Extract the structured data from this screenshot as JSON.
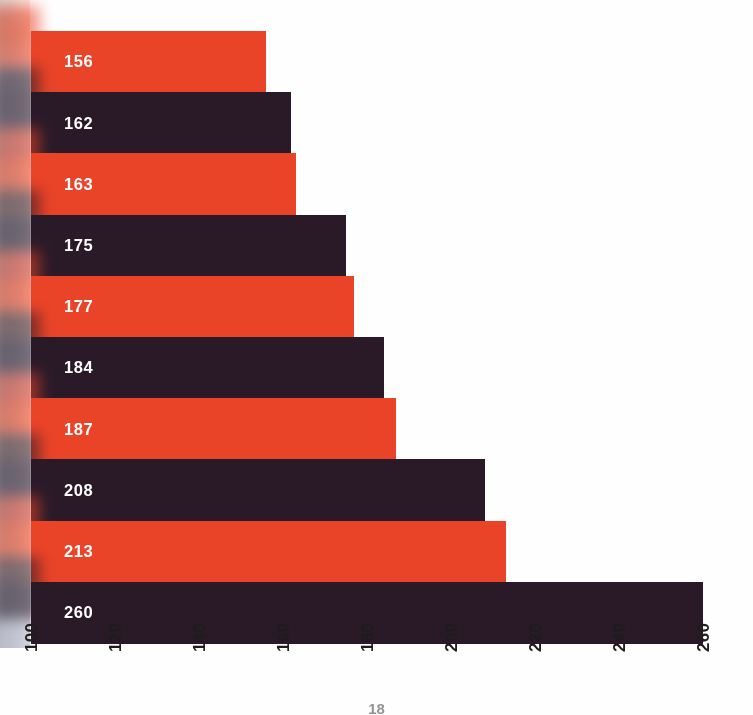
{
  "chart_data": {
    "type": "bar",
    "orientation": "horizontal",
    "title": "",
    "subtitle": "",
    "xlabel": "",
    "ylabel": "",
    "categories": [
      "1",
      "2",
      "3",
      "4",
      "5",
      "6",
      "7",
      "8",
      "9",
      "10"
    ],
    "values": [
      156,
      162,
      163,
      175,
      177,
      184,
      187,
      208,
      213,
      260
    ],
    "data_labels": [
      "156",
      "162",
      "163",
      "175",
      "177",
      "184",
      "187",
      "208",
      "213",
      "260"
    ],
    "bar_colors": [
      "#ea4428",
      "#2a1a28",
      "#ea4428",
      "#2a1a28",
      "#ea4428",
      "#2a1a28",
      "#ea4428",
      "#2a1a28",
      "#ea4428",
      "#2a1a28"
    ],
    "xlim": [
      100,
      260
    ],
    "ylim": [
      0,
      10
    ],
    "xticks": [
      100,
      120,
      140,
      160,
      180,
      200,
      220,
      240,
      260
    ],
    "xtick_labels": [
      "100",
      "120",
      "140",
      "160",
      "180",
      "200",
      "220",
      "240",
      "260"
    ],
    "xtick_rotation": 90,
    "yticks": [],
    "ytick_labels": [],
    "grid": false,
    "legend": null,
    "annotations": [],
    "bar_gap": 0,
    "baseline": 100
  },
  "figure": {
    "background_color": "#ffffff",
    "accent_color": "#ea4428",
    "dark_color": "#2a1a28",
    "label_color": "#ffffff",
    "tick_color": "#1d1d1d",
    "width": 753,
    "height": 715
  },
  "footer": {
    "folio": "18"
  }
}
